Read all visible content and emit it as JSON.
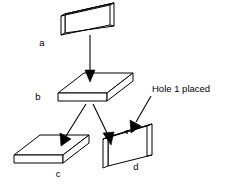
{
  "diagram": {
    "background_color": "#ffffff",
    "stroke_color": "#000000",
    "labels": {
      "block_a": "a",
      "block_b": "b",
      "block_c": "c",
      "block_d": "d"
    },
    "annotation": {
      "hole_note": "Hole 1 placed"
    },
    "blocks": [
      {
        "id": "a",
        "label": "a",
        "orientation": "upright-slab",
        "label_position": {
          "x": 42,
          "y": 46
        }
      },
      {
        "id": "b",
        "label": "b",
        "orientation": "flat-slab",
        "label_position": {
          "x": 38,
          "y": 100
        }
      },
      {
        "id": "c",
        "label": "c",
        "orientation": "flat-slab",
        "label_position": {
          "x": 58,
          "y": 177
        }
      },
      {
        "id": "d",
        "label": "d",
        "orientation": "upright-slab",
        "label_position": {
          "x": 136,
          "y": 170
        }
      }
    ],
    "arrows": [
      {
        "id": "a-to-b",
        "from": "a",
        "to": "b",
        "direction": "down"
      },
      {
        "id": "b-to-c",
        "from": "b",
        "to": "c",
        "direction": "down-left"
      },
      {
        "id": "b-to-d",
        "from": "b",
        "to": "d",
        "direction": "down-right"
      },
      {
        "id": "note-to-d",
        "from": "Hole 1 placed",
        "to": "d",
        "direction": "down-left"
      }
    ]
  }
}
